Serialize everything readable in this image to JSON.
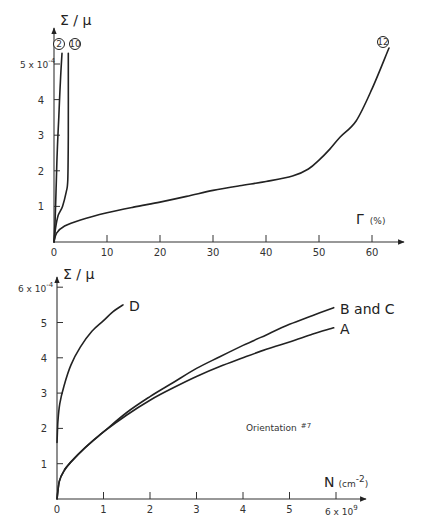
{
  "chart_data": [
    {
      "type": "line",
      "title": "",
      "xlabel": "Γ (%)",
      "ylabel": "Σ / μ",
      "y_scale_label": "5 x 10^-4",
      "x_ticks": [
        "0",
        "10",
        "20",
        "30",
        "40",
        "50",
        "60"
      ],
      "y_ticks": [
        "1",
        "2",
        "3",
        "4",
        "5 x 10^-4"
      ],
      "xlim": [
        0,
        66
      ],
      "ylim": [
        0,
        5.6
      ],
      "grid": false,
      "series": [
        {
          "name": "2",
          "label_style": "circled",
          "x": [
            0,
            0.2,
            0.4,
            0.6,
            0.9,
            1.2,
            1.5
          ],
          "y": [
            0,
            0.6,
            1.5,
            2.5,
            3.5,
            4.5,
            5.3
          ]
        },
        {
          "name": "10",
          "label_style": "circled",
          "x": [
            0,
            0.3,
            0.8,
            1.6,
            2.3,
            2.6,
            2.7,
            2.7
          ],
          "y": [
            0,
            0.4,
            0.75,
            1.0,
            1.4,
            1.75,
            3.0,
            5.3
          ]
        },
        {
          "name": "12",
          "label_style": "circled",
          "x": [
            0,
            0.5,
            2,
            5,
            10,
            15,
            20,
            25,
            30,
            35,
            40,
            45,
            48,
            50,
            52,
            54,
            57,
            60,
            63.2
          ],
          "y": [
            0,
            0.25,
            0.45,
            0.62,
            0.82,
            0.98,
            1.12,
            1.28,
            1.45,
            1.58,
            1.7,
            1.85,
            2.05,
            2.3,
            2.6,
            2.95,
            3.4,
            4.3,
            5.45
          ]
        }
      ]
    },
    {
      "type": "line",
      "title": "",
      "xlabel": "N (cm^-2)",
      "ylabel": "Σ / μ",
      "x_scale_label": "6 x 10^9",
      "y_scale_label": "6 x 10^-4",
      "annotation": "Orientation #7",
      "x_ticks": [
        "0",
        "1",
        "2",
        "3",
        "4",
        "5",
        "6 x 10^9"
      ],
      "y_ticks": [
        "1",
        "2",
        "3",
        "4",
        "5",
        "6 x 10^-4"
      ],
      "xlim": [
        0,
        6.6
      ],
      "ylim": [
        0,
        6.2
      ],
      "grid": false,
      "series": [
        {
          "name": "D",
          "x": [
            0,
            0.02,
            0.06,
            0.15,
            0.3,
            0.5,
            0.75,
            1.0,
            1.2,
            1.42
          ],
          "y": [
            1.6,
            2.2,
            2.7,
            3.2,
            3.8,
            4.3,
            4.75,
            5.05,
            5.3,
            5.5
          ]
        },
        {
          "name": "B and C",
          "x": [
            0,
            0.05,
            0.15,
            0.3,
            0.6,
            1.0,
            1.5,
            2.0,
            2.5,
            3.0,
            3.5,
            4.0,
            4.5,
            5.0,
            5.5,
            5.95
          ],
          "y": [
            0,
            0.5,
            0.8,
            1.05,
            1.45,
            1.9,
            2.45,
            2.9,
            3.3,
            3.7,
            4.03,
            4.35,
            4.65,
            4.95,
            5.2,
            5.42
          ]
        },
        {
          "name": "A",
          "x": [
            0,
            0.05,
            0.15,
            0.3,
            0.6,
            1.0,
            1.5,
            2.0,
            2.5,
            3.0,
            3.5,
            4.0,
            4.5,
            5.0,
            5.5,
            5.95
          ],
          "y": [
            0,
            0.5,
            0.8,
            1.05,
            1.45,
            1.9,
            2.38,
            2.8,
            3.15,
            3.47,
            3.75,
            4.0,
            4.24,
            4.45,
            4.67,
            4.85
          ]
        }
      ]
    }
  ],
  "labels": {
    "top": {
      "ylabel": "Σ / μ",
      "xlabel_symbol": "Γ",
      "xlabel_unit": "(%)",
      "y_scale": "5 x 10",
      "y_scale_exp": "-4",
      "circle_2": "2",
      "circle_10": "10",
      "circle_12": "12"
    },
    "bottom": {
      "ylabel": "Σ / μ",
      "xlabel_symbol": "N",
      "xlabel_unit": "(cm",
      "xlabel_unit_exp": "-2",
      "xlabel_unit_close": ")",
      "y_scale": "6 x 10",
      "y_scale_exp": "-4",
      "x_scale": "6 x 10",
      "x_scale_exp": "9",
      "label_D": "D",
      "label_BC": "B and C",
      "label_A": "A",
      "annotation": "Orientation",
      "annotation_sup": "#7"
    }
  }
}
